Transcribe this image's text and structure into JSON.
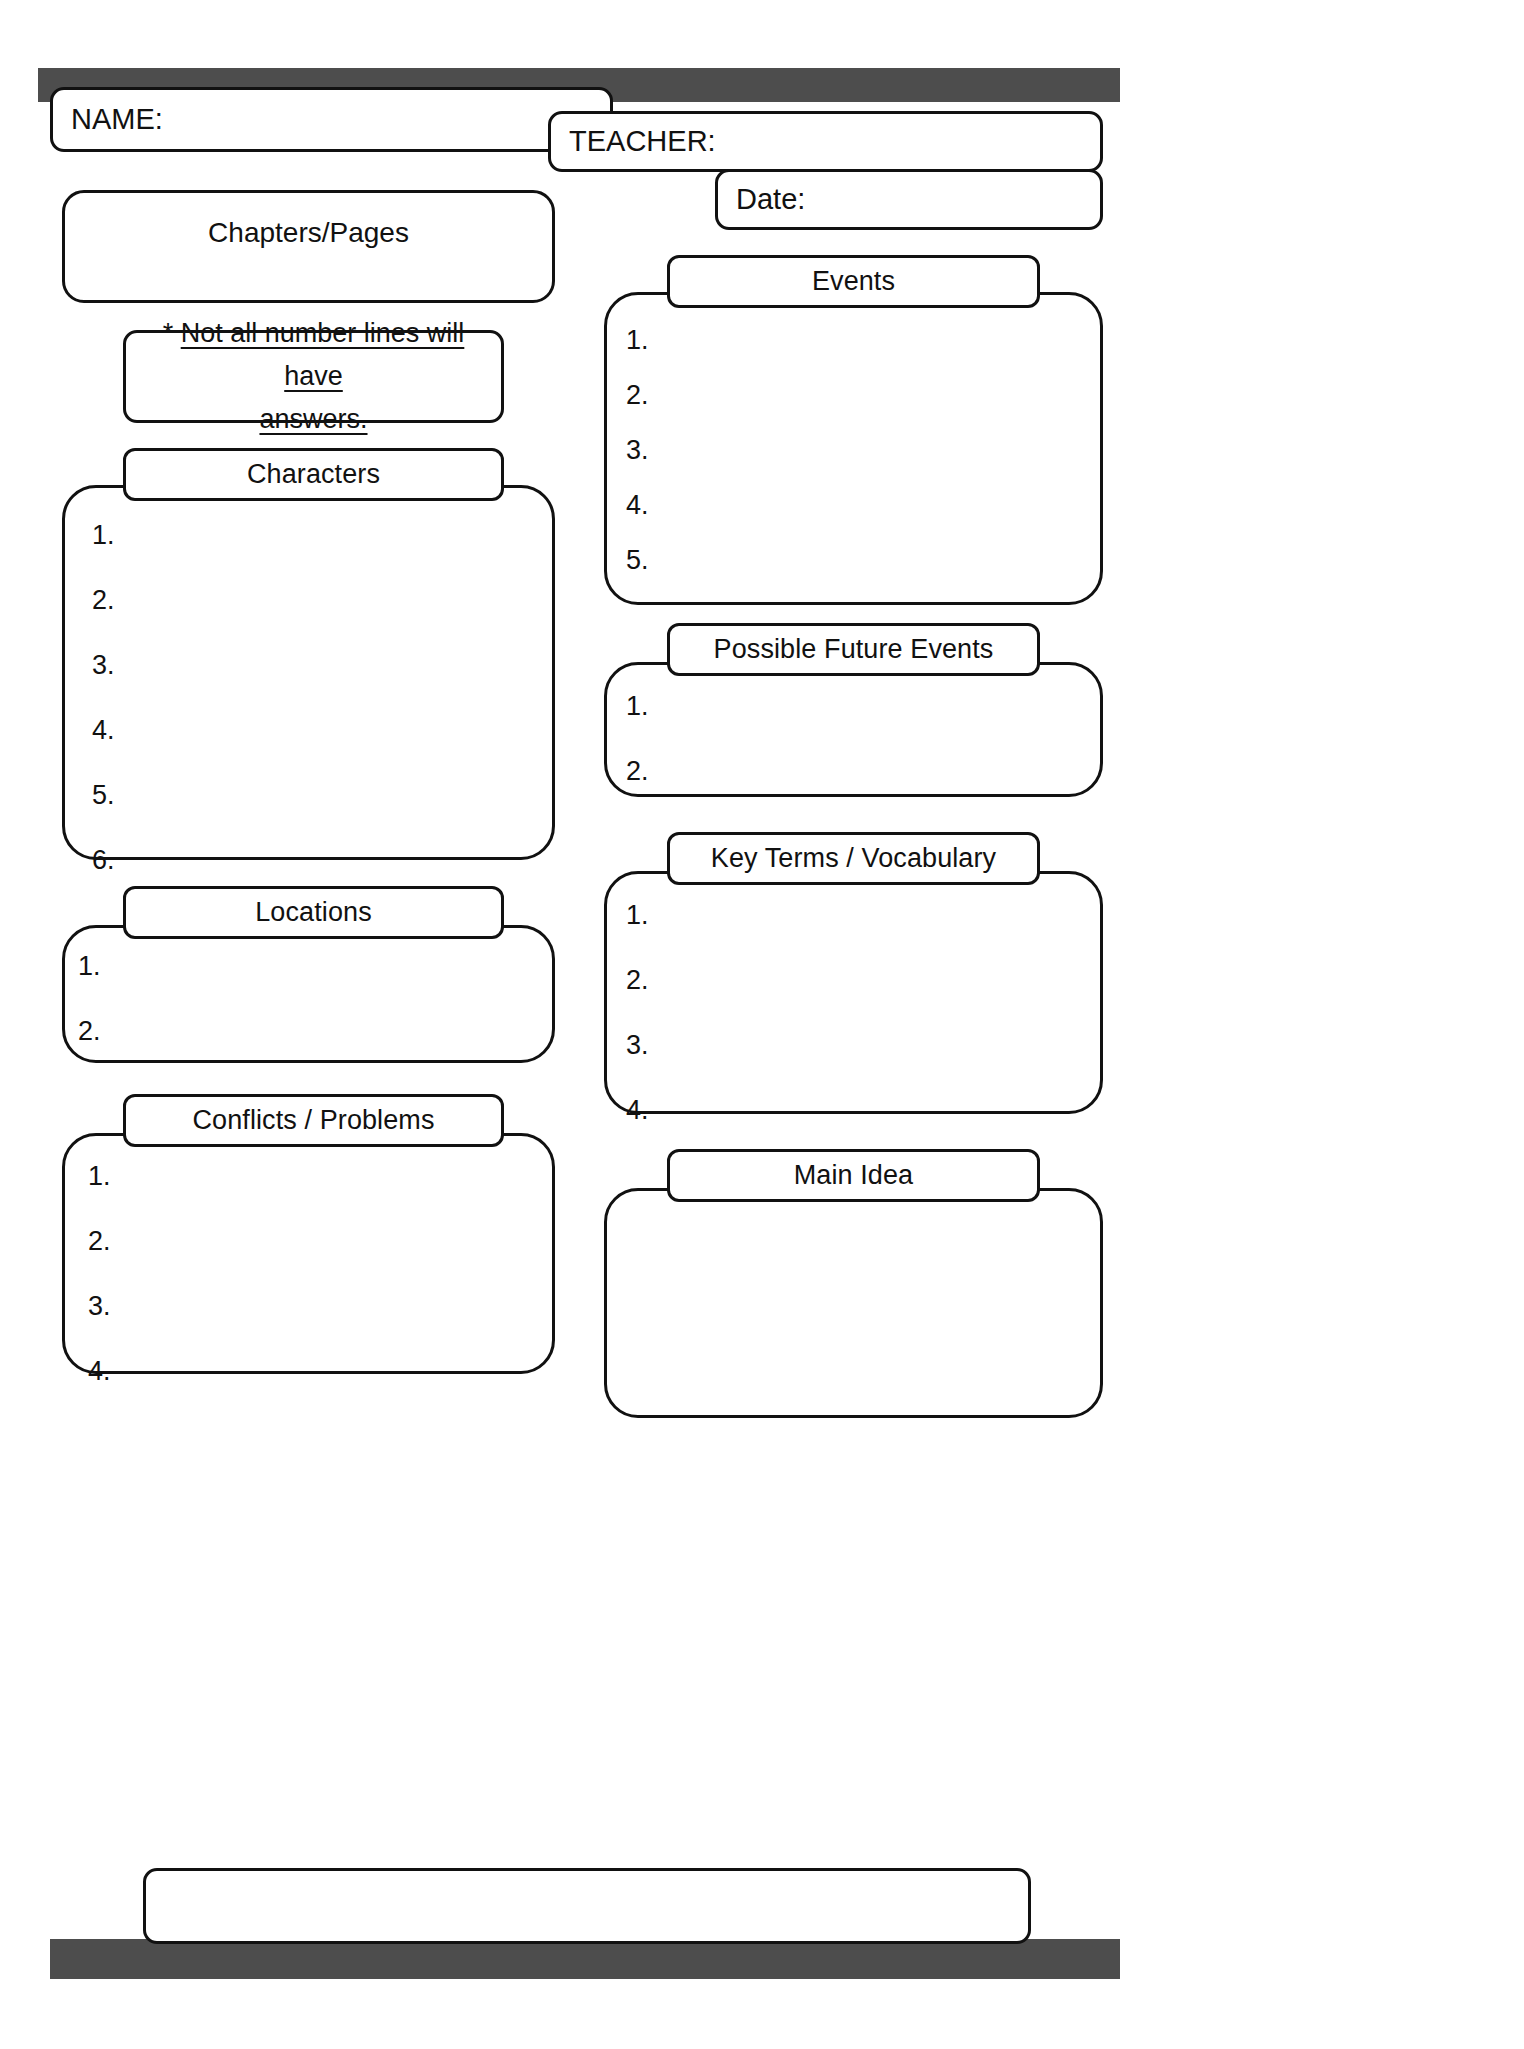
{
  "page": {
    "type": "reading-log-worksheet",
    "background_color": "#ffffff",
    "bar_color": "#4d4d4d",
    "line_color": "#111111"
  },
  "header": {
    "name_label": "NAME:",
    "teacher_label": "TEACHER:",
    "date_label": "Date:"
  },
  "note": {
    "star": "* ",
    "line1": "Not all number lines will have",
    "line2": "answers."
  },
  "sections": {
    "chapters_pages": {
      "title": "Chapters/Pages"
    },
    "characters": {
      "title": "Characters",
      "items": [
        "1.",
        "2.",
        "3.",
        "4.",
        "5.",
        "6."
      ]
    },
    "locations": {
      "title": "Locations",
      "items": [
        "1.",
        "2."
      ]
    },
    "conflicts_problems": {
      "title": "Conflicts / Problems",
      "items": [
        "1.",
        "2.",
        "3.",
        "4."
      ]
    },
    "events": {
      "title": "Events",
      "items": [
        "1.",
        "2.",
        "3.",
        "4.",
        "5."
      ]
    },
    "possible_future_events": {
      "title": "Possible Future Events",
      "items": [
        "1.",
        "2."
      ]
    },
    "key_terms_vocabulary": {
      "title": "Key Terms / Vocabulary",
      "items": [
        "1.",
        "2.",
        "3.",
        "4."
      ]
    },
    "main_idea": {
      "title": "Main Idea"
    }
  },
  "footer": {
    "answer_box_value": ""
  }
}
